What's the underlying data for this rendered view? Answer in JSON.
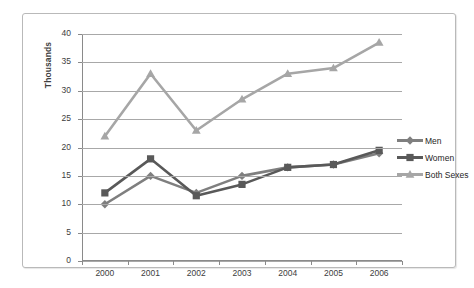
{
  "chart_data": {
    "type": "line",
    "title": "",
    "xlabel": "",
    "ylabel": "Thousands",
    "categories": [
      "2000",
      "2001",
      "2002",
      "2003",
      "2004",
      "2005",
      "2006"
    ],
    "ylim": [
      0,
      40
    ],
    "ytick_step": 5,
    "yticks": [
      "0",
      "5",
      "10",
      "15",
      "20",
      "25",
      "30",
      "35",
      "40"
    ],
    "grid": "horizontal",
    "legend_position": "right",
    "series": [
      {
        "name": "Men",
        "color": "#7f7f7f",
        "marker": "diamond",
        "values": [
          10,
          15,
          12,
          15,
          16.5,
          17,
          19
        ]
      },
      {
        "name": "Women",
        "color": "#595959",
        "marker": "square",
        "values": [
          12,
          18,
          11.5,
          13.5,
          16.5,
          17,
          19.5
        ]
      },
      {
        "name": "Both Sexes",
        "color": "#a6a6a6",
        "marker": "triangle",
        "values": [
          22,
          33,
          23,
          28.5,
          33,
          34,
          38.5
        ]
      }
    ]
  },
  "colors": {
    "men": "#7f7f7f",
    "women": "#595959",
    "both_sexes": "#a6a6a6",
    "gridline": "#a8a8a8",
    "axis": "#8a8a8a",
    "border": "#b9b9b9",
    "text": "#3d3d3d"
  }
}
